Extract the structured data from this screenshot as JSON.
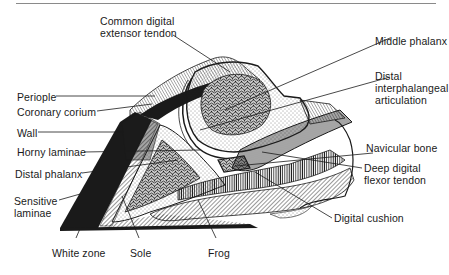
{
  "figure": {
    "colors": {
      "ink": "#1a1a1a",
      "rule": "#8a8a8a",
      "background": "#ffffff"
    }
  },
  "labels": {
    "common_digital_extensor_tendon": [
      "Common digital",
      "extensor tendon"
    ],
    "middle_phalanx": "Middle phalanx",
    "distal_interphalangeal_articulation": [
      "Distal",
      "interphalangeal",
      "articulation"
    ],
    "periople": "Periople",
    "coronary_corium": "Coronary corium",
    "wall": "Wall",
    "horny_laminae": "Horny laminae",
    "navicular_bone": "Navicular bone",
    "distal_phalanx": "Distal phalanx",
    "deep_digital_flexor_tendon": [
      "Deep digital",
      "flexor tendon"
    ],
    "sensitive_laminae": [
      "Sensitive",
      "laminae"
    ],
    "digital_cushion": "Digital cushion",
    "white_zone": "White zone",
    "sole": "Sole",
    "frog": "Frog"
  }
}
